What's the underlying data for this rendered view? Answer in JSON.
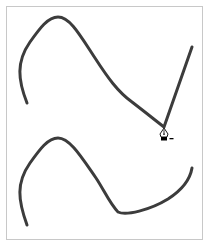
{
  "canvas": {
    "background": "#ffffff",
    "border_color": "#c8c8c8",
    "stroke_color": "#3c3c3c"
  },
  "paths": [
    {
      "name": "top-path",
      "points": [
        [
          27,
          103
        ],
        [
          19,
          70
        ],
        [
          55,
          17
        ],
        [
          115,
          85
        ],
        [
          164,
          127
        ],
        [
          192,
          47
        ]
      ],
      "d": "M27,103 C18,80 16,62 30,42 C40,28 48,17 58,17 C70,17 80,35 95,58 C108,78 118,92 132,102 C145,112 155,120 164,127 L192,47"
    },
    {
      "name": "bottom-path",
      "points": [
        [
          27,
          225
        ],
        [
          19,
          192
        ],
        [
          55,
          138
        ],
        [
          118,
          213
        ],
        [
          192,
          168
        ]
      ],
      "d": "M27,225 C18,200 16,183 30,163 C40,149 48,138 58,138 C70,138 82,158 96,178 C104,190 110,204 118,212 C126,216 150,210 168,199 C182,190 190,180 192,168"
    }
  ],
  "cursor": {
    "tool": "pen-delete-anchor-point",
    "modifier_symbol": "−",
    "x": 164,
    "y": 128
  }
}
